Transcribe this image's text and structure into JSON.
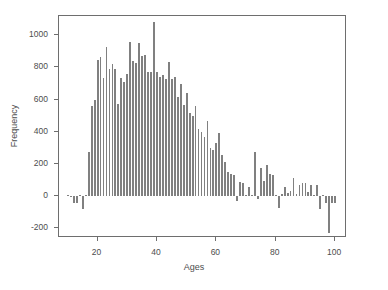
{
  "chart_data": {
    "type": "bar",
    "title": "",
    "xlabel": "Ages",
    "ylabel": "Frequency",
    "xlim": [
      7,
      104
    ],
    "ylim": [
      -260,
      1120
    ],
    "grid": false,
    "legend": null,
    "bar_color": "#808080",
    "axis_color": "#6e6e6e",
    "text_color": "#4d4d4d",
    "background": "#ffffff",
    "xticks": [
      20,
      40,
      60,
      80,
      100
    ],
    "yticks": [
      -200,
      0,
      200,
      400,
      600,
      800,
      1000
    ],
    "xtick_labels": [
      "20",
      "40",
      "60",
      "80",
      "100"
    ],
    "ytick_labels": [
      "-200",
      "0",
      "200",
      "400",
      "600",
      "800",
      "1000"
    ],
    "categories": [
      10,
      11,
      12,
      13,
      14,
      15,
      16,
      17,
      18,
      19,
      20,
      21,
      22,
      23,
      24,
      25,
      26,
      27,
      28,
      29,
      30,
      31,
      32,
      33,
      34,
      35,
      36,
      37,
      38,
      39,
      40,
      41,
      42,
      43,
      44,
      45,
      46,
      47,
      48,
      49,
      50,
      51,
      52,
      53,
      54,
      55,
      56,
      57,
      58,
      59,
      60,
      61,
      62,
      63,
      64,
      65,
      66,
      67,
      68,
      69,
      70,
      71,
      72,
      73,
      74,
      75,
      76,
      77,
      78,
      79,
      80,
      81,
      82,
      83,
      84,
      85,
      86,
      87,
      88,
      89,
      90,
      91,
      92,
      93,
      94,
      95,
      96,
      97,
      98,
      99,
      100
    ],
    "values": [
      8,
      2,
      -45,
      -40,
      6,
      -80,
      10,
      275,
      560,
      600,
      845,
      865,
      735,
      930,
      790,
      820,
      790,
      570,
      735,
      710,
      760,
      960,
      840,
      830,
      955,
      870,
      880,
      775,
      770,
      1085,
      770,
      740,
      755,
      730,
      835,
      730,
      740,
      615,
      700,
      565,
      640,
      520,
      500,
      560,
      420,
      400,
      365,
      470,
      300,
      290,
      330,
      395,
      255,
      210,
      150,
      140,
      130,
      -30,
      90,
      85,
      10,
      60,
      10,
      275,
      -20,
      175,
      95,
      195,
      140,
      130,
      5,
      -75,
      15,
      55,
      20,
      30,
      110,
      15,
      70,
      80,
      80,
      25,
      70,
      5,
      70,
      -80,
      8,
      -40,
      -230,
      -40,
      -40
    ],
    "tallest_bar": {
      "age": 39,
      "value": 1085
    },
    "lowest_bar": {
      "age": 98,
      "value": -230
    }
  }
}
